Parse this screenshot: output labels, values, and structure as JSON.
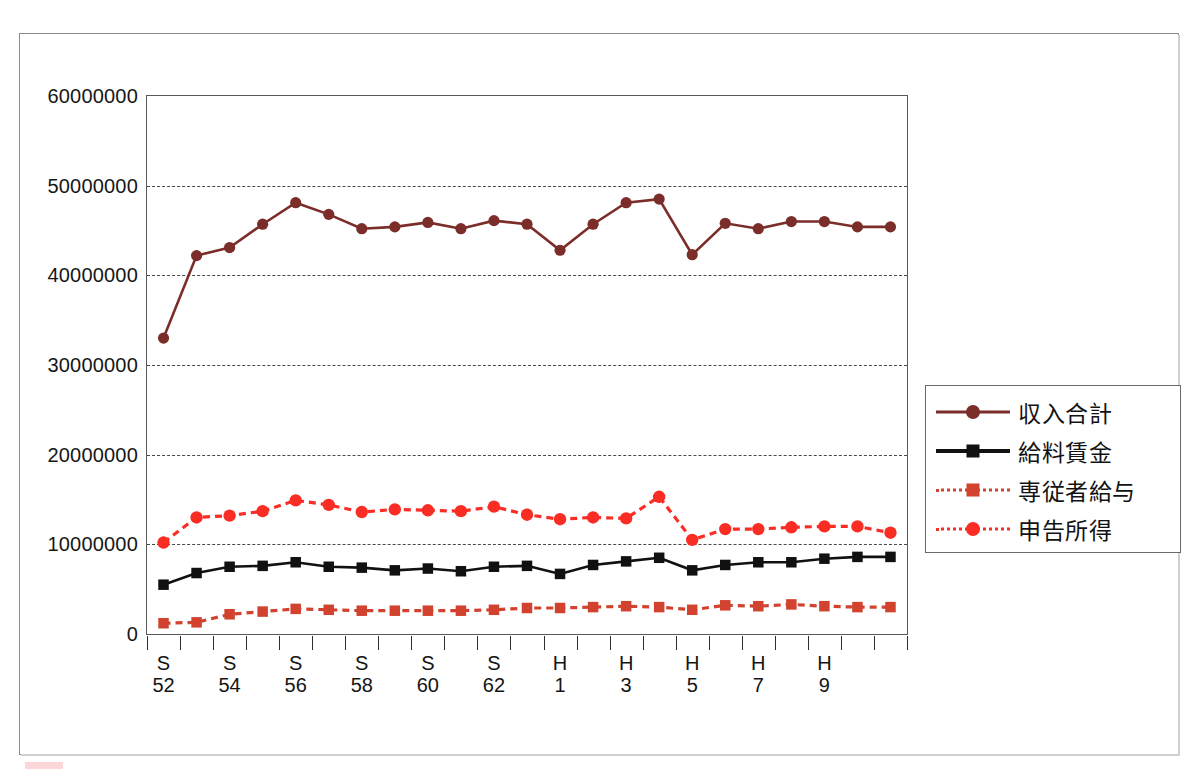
{
  "chart_data": {
    "type": "line",
    "title": "",
    "xlabel": "",
    "ylabel": "",
    "ylim": [
      0,
      60000000
    ],
    "grid": true,
    "legend_position": "right",
    "y_ticks": [
      "0",
      "10000000",
      "20000000",
      "30000000",
      "40000000",
      "50000000",
      "60000000"
    ],
    "y_tick_values": [
      0,
      10000000,
      20000000,
      30000000,
      40000000,
      50000000,
      60000000
    ],
    "categories": [
      "S52",
      "S53",
      "S54",
      "S55",
      "S56",
      "S57",
      "S58",
      "S59",
      "S60",
      "S61",
      "S62",
      "S63",
      "H1",
      "H2",
      "H3",
      "H4",
      "H5",
      "H6",
      "H7",
      "H8",
      "H9",
      "H10",
      "H11"
    ],
    "x_tick_labels": [
      {
        "era": "S",
        "year": "52"
      },
      {
        "era": "S",
        "year": "54"
      },
      {
        "era": "S",
        "year": "56"
      },
      {
        "era": "S",
        "year": "58"
      },
      {
        "era": "S",
        "year": "60"
      },
      {
        "era": "S",
        "year": "62"
      },
      {
        "era": "H",
        "year": "1"
      },
      {
        "era": "H",
        "year": "3"
      },
      {
        "era": "H",
        "year": "5"
      },
      {
        "era": "H",
        "year": "7"
      },
      {
        "era": "H",
        "year": "9"
      }
    ],
    "series": [
      {
        "name": "収入合計",
        "color": "#7b2d2a",
        "style": "solid",
        "marker": "circle",
        "values": [
          33000000,
          42200000,
          43100000,
          45700000,
          48100000,
          46800000,
          45200000,
          45400000,
          45900000,
          45200000,
          46100000,
          45700000,
          42800000,
          45700000,
          48100000,
          48500000,
          42300000,
          45800000,
          45200000,
          46000000,
          46000000,
          45400000,
          45400000
        ]
      },
      {
        "name": "給料賃金",
        "color": "#111111",
        "style": "solid",
        "marker": "square",
        "values": [
          5500000,
          6800000,
          7500000,
          7600000,
          8000000,
          7500000,
          7400000,
          7100000,
          7300000,
          7000000,
          7500000,
          7600000,
          6700000,
          7700000,
          8100000,
          8500000,
          7100000,
          7700000,
          8000000,
          8000000,
          8400000,
          8600000,
          8600000
        ]
      },
      {
        "name": "専従者給与",
        "color": "#d1432f",
        "style": "dotted",
        "marker": "square",
        "values": [
          1200000,
          1300000,
          2200000,
          2500000,
          2800000,
          2700000,
          2600000,
          2600000,
          2600000,
          2600000,
          2700000,
          2900000,
          2900000,
          3000000,
          3100000,
          3000000,
          2700000,
          3200000,
          3100000,
          3300000,
          3100000,
          3000000,
          3000000
        ]
      },
      {
        "name": "申告所得",
        "color": "#fa2d24",
        "style": "dotted",
        "marker": "circle",
        "values": [
          10200000,
          13000000,
          13200000,
          13700000,
          14900000,
          14400000,
          13600000,
          13900000,
          13800000,
          13700000,
          14200000,
          13300000,
          12800000,
          13000000,
          12900000,
          15300000,
          10500000,
          11700000,
          11700000,
          11900000,
          12000000,
          12000000,
          11300000
        ]
      }
    ]
  },
  "legend": {
    "items": [
      {
        "label": "収入合計"
      },
      {
        "label": "給料賃金"
      },
      {
        "label": "専従者給与"
      },
      {
        "label": "申告所得"
      }
    ]
  }
}
